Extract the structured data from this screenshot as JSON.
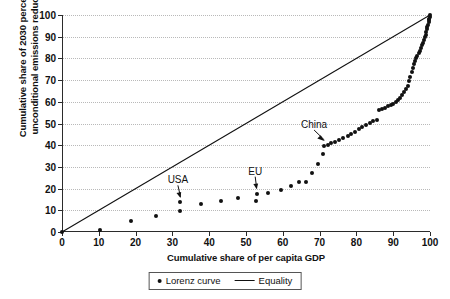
{
  "chart_data": {
    "type": "scatter",
    "title": "",
    "xlabel": "Cumulative share of per capita GDP",
    "ylabel_line1": "Cumulative share of 2030 percentage",
    "ylabel_line2": "unconditional  emissions reductions",
    "xlim": [
      0,
      100
    ],
    "ylim": [
      0,
      100
    ],
    "xticks": [
      0,
      10,
      20,
      30,
      40,
      50,
      60,
      70,
      80,
      90,
      100
    ],
    "yticks": [
      0,
      10,
      20,
      30,
      40,
      50,
      60,
      70,
      80,
      90,
      100
    ],
    "grid": "horizontal-dotted",
    "legend_position": "below-axes",
    "series": [
      {
        "name": "Lorenz curve",
        "marker": "dot",
        "color": "#111111",
        "points": [
          [
            0.0,
            0.0
          ],
          [
            10.3,
            1.0
          ],
          [
            18.7,
            5.0
          ],
          [
            25.6,
            7.6
          ],
          [
            32.0,
            9.7
          ],
          [
            32.2,
            13.6
          ],
          [
            37.8,
            13.0
          ],
          [
            43.2,
            14.3
          ],
          [
            47.8,
            15.6
          ],
          [
            52.8,
            14.2
          ],
          [
            52.9,
            17.6
          ],
          [
            56.0,
            18.0
          ],
          [
            59.4,
            19.2
          ],
          [
            62.3,
            21.0
          ],
          [
            64.4,
            23.0
          ],
          [
            66.3,
            23.2
          ],
          [
            68.0,
            27.0
          ],
          [
            69.5,
            31.5
          ],
          [
            70.8,
            36.0
          ],
          [
            71.3,
            39.5
          ],
          [
            72.2,
            40.3
          ],
          [
            73.2,
            40.8
          ],
          [
            74.2,
            41.5
          ],
          [
            75.3,
            42.2
          ],
          [
            76.4,
            43.2
          ],
          [
            77.6,
            44.3
          ],
          [
            78.6,
            45.2
          ],
          [
            79.6,
            46.3
          ],
          [
            80.6,
            47.5
          ],
          [
            81.6,
            48.5
          ],
          [
            82.6,
            49.5
          ],
          [
            83.6,
            50.3
          ],
          [
            84.6,
            51.0
          ],
          [
            85.5,
            51.6
          ],
          [
            86.2,
            56.0
          ],
          [
            87.0,
            56.6
          ],
          [
            87.8,
            57.2
          ],
          [
            88.6,
            57.9
          ],
          [
            89.3,
            58.5
          ],
          [
            90.0,
            59.2
          ],
          [
            90.7,
            60.0
          ],
          [
            91.3,
            60.8
          ],
          [
            91.9,
            61.8
          ],
          [
            92.4,
            63.0
          ],
          [
            92.9,
            64.3
          ],
          [
            93.4,
            65.8
          ],
          [
            93.9,
            67.5
          ],
          [
            94.3,
            69.4
          ],
          [
            94.7,
            71.5
          ],
          [
            95.1,
            73.6
          ],
          [
            95.4,
            75.5
          ],
          [
            95.7,
            77.2
          ],
          [
            96.0,
            78.7
          ],
          [
            96.3,
            80.0
          ],
          [
            96.6,
            81.2
          ],
          [
            96.9,
            82.4
          ],
          [
            97.2,
            83.6
          ],
          [
            97.5,
            84.8
          ],
          [
            97.8,
            86.0
          ],
          [
            98.1,
            87.3
          ],
          [
            98.4,
            88.6
          ],
          [
            98.6,
            89.8
          ],
          [
            98.8,
            91.0
          ],
          [
            99.0,
            92.2
          ],
          [
            99.2,
            93.4
          ],
          [
            99.3,
            94.5
          ],
          [
            99.5,
            95.6
          ],
          [
            99.6,
            96.6
          ],
          [
            99.7,
            97.5
          ],
          [
            99.8,
            98.3
          ],
          [
            99.9,
            99.2
          ],
          [
            100.0,
            100.0
          ]
        ]
      },
      {
        "name": "Equality",
        "marker": "line",
        "color": "#111111",
        "points": [
          [
            0,
            0
          ],
          [
            100,
            100
          ]
        ]
      }
    ],
    "annotations": [
      {
        "label": "USA",
        "label_x": 31.5,
        "label_y": 21.5,
        "target_x": 32.2,
        "target_y": 14.8
      },
      {
        "label": "EU",
        "label_x": 52.5,
        "label_y": 25.5,
        "target_x": 52.9,
        "target_y": 18.8
      },
      {
        "label": "China",
        "label_x": 68.5,
        "label_y": 47.0,
        "target_x": 71.3,
        "target_y": 41.0
      }
    ],
    "legend": [
      {
        "label": "Lorenz curve",
        "marker": "dot"
      },
      {
        "label": "Equality",
        "marker": "line"
      }
    ]
  }
}
